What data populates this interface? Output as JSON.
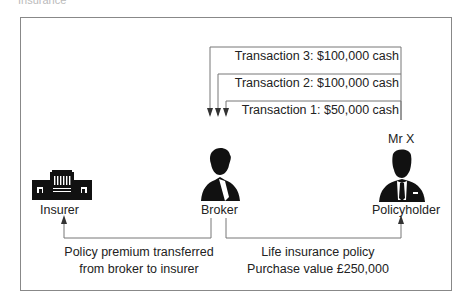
{
  "heading": "Insurance",
  "transactions": [
    {
      "label": "Transaction 3: $100,000 cash"
    },
    {
      "label": "Transaction 2: $100,000 cash"
    },
    {
      "label": "Transaction 1: $50,000 cash"
    }
  ],
  "nodes": {
    "insurer": {
      "label": "Insurer",
      "icon": "building-icon"
    },
    "broker": {
      "label": "Broker",
      "icon": "person-icon"
    },
    "policyholder": {
      "label": "Policyholder",
      "name": "Mr X",
      "icon": "person-suit-icon"
    }
  },
  "captions": {
    "left": {
      "line1": "Policy premium transferred",
      "line2": "from broker to insurer"
    },
    "right": {
      "line1": "Life insurance policy",
      "line2": "Purchase value £250,000"
    }
  },
  "colors": {
    "line": "#666666",
    "text": "#222222",
    "frame": "#888888"
  }
}
